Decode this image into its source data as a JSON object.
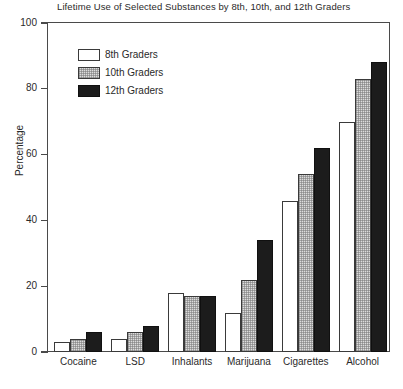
{
  "chart_data": {
    "type": "bar",
    "title": "Lifetime Use of Selected Substances by 8th, 10th, and 12th Graders",
    "xlabel": "",
    "ylabel": "Percentage",
    "ylim": [
      0,
      100
    ],
    "yticks": [
      0,
      20,
      40,
      60,
      80,
      100
    ],
    "grid": false,
    "legend_position": "upper-left-inside",
    "categories": [
      "Cocaine",
      "LSD",
      "Inhalants",
      "Marijuana",
      "Cigarettes",
      "Alcohol"
    ],
    "series": [
      {
        "name": "8th Graders",
        "style": "white",
        "color": "#ffffff",
        "values": [
          3,
          4,
          18,
          12,
          46,
          70
        ]
      },
      {
        "name": "10th Graders",
        "style": "hatched",
        "color": "#dcdcdc",
        "values": [
          4,
          6,
          17,
          22,
          54,
          83
        ]
      },
      {
        "name": "12th Graders",
        "style": "solid",
        "color": "#1c1c1c",
        "values": [
          6,
          8,
          17,
          34,
          62,
          88
        ]
      }
    ]
  },
  "axis": {
    "tick_labels": [
      "100",
      "80",
      "60",
      "40",
      "20",
      "0"
    ],
    "y_title": "Percentage"
  },
  "legend": {
    "items": [
      {
        "label": "8th Graders"
      },
      {
        "label": "10th Graders"
      },
      {
        "label": "12th Graders"
      }
    ]
  }
}
